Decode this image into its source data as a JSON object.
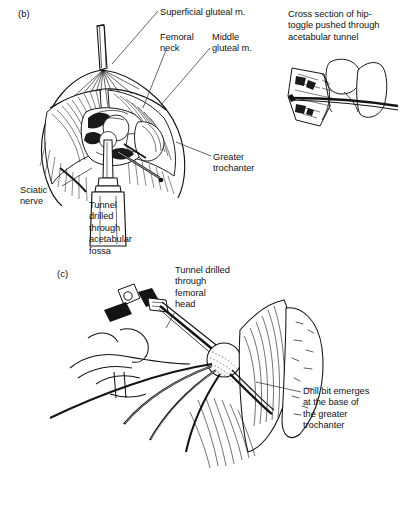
{
  "figure": {
    "panels": [
      {
        "id": "panel-b",
        "tag": "(b)",
        "tag_x": 18,
        "tag_y": 8,
        "description": "Surgical exposure of the hip joint with gluteal muscles retracted, showing a drill guide passed into the acetabular fossa"
      },
      {
        "id": "panel-c",
        "tag": "(c)",
        "tag_x": 57,
        "tag_y": 268,
        "description": "Drill passed through the femoral head emerging at the base of the greater trochanter"
      }
    ],
    "labels": [
      {
        "name": "superficial-gluteal-label",
        "text": "Superficial gluteal m.",
        "x": 160,
        "y": 7,
        "width": 130,
        "align": "left"
      },
      {
        "name": "femoral-neck-label",
        "text": "Femoral\nneck",
        "x": 160,
        "y": 32,
        "width": 52,
        "align": "left"
      },
      {
        "name": "middle-gluteal-label",
        "text": "Middle\ngluteal m.",
        "x": 212,
        "y": 32,
        "width": 62,
        "align": "left"
      },
      {
        "name": "cross-section-inset-caption",
        "text": "Cross section of hip-\ntoggle pushed through\nacetabular tunnel",
        "x": 288,
        "y": 9,
        "width": 112,
        "align": "left"
      },
      {
        "name": "greater-trochanter-label-b",
        "text": "Greater\ntrochanter",
        "x": 213,
        "y": 152,
        "width": 70,
        "align": "left"
      },
      {
        "name": "sciatic-nerve-label",
        "text": "Sciatic\nnerve",
        "x": 20,
        "y": 185,
        "width": 52,
        "align": "left"
      },
      {
        "name": "acetabular-tunnel-label",
        "text": "Tunnel\ndrilled\nthrough\nacetabular\nfossa",
        "x": 89,
        "y": 200,
        "width": 70,
        "align": "left"
      },
      {
        "name": "femoral-head-tunnel-label",
        "text": "Tunnel drilled\nthrough\nfemoral\nhead",
        "x": 175,
        "y": 265,
        "width": 82,
        "align": "left"
      },
      {
        "name": "drill-bit-emerges-label",
        "text": "Drill bit emerges\nat the base of\nthe greater\ntrochanter",
        "x": 303,
        "y": 386,
        "width": 96,
        "align": "left"
      }
    ],
    "colors": {
      "ink": "#141414",
      "background": "#ffffff",
      "leader": "#333333"
    }
  }
}
